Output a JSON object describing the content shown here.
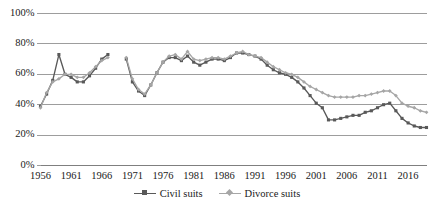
{
  "chart_data": {
    "type": "line",
    "title": "",
    "xlabel": "",
    "ylabel": "",
    "xlim": [
      1956,
      2019
    ],
    "ylim": [
      0,
      100
    ],
    "grid": true,
    "grid_axis": "y",
    "legend_position": "bottom-center",
    "y_ticks": [
      0,
      20,
      40,
      60,
      80,
      100
    ],
    "y_tick_labels": [
      "0%",
      "20%",
      "40%",
      "60%",
      "80%",
      "100%"
    ],
    "x_ticks": [
      1956,
      1961,
      1966,
      1971,
      1976,
      1981,
      1986,
      1991,
      1996,
      2001,
      2006,
      2011,
      2016
    ],
    "x_tick_labels": [
      "1956",
      "1961",
      "1966",
      "1971",
      "1976",
      "1981",
      "1986",
      "1991",
      "1996",
      "2001",
      "2006",
      "2011",
      "2016"
    ],
    "note": "Two series share the same year axis; both have a data gap for 1968 and 1969.",
    "series": [
      {
        "name": "Civil suits",
        "color": "#595959",
        "marker": "square",
        "x": [
          1956,
          1957,
          1958,
          1959,
          1960,
          1961,
          1962,
          1963,
          1964,
          1965,
          1966,
          1967,
          1968,
          1969,
          1970,
          1971,
          1972,
          1973,
          1974,
          1975,
          1976,
          1977,
          1978,
          1979,
          1980,
          1981,
          1982,
          1983,
          1984,
          1985,
          1986,
          1987,
          1988,
          1989,
          1990,
          1991,
          1992,
          1993,
          1994,
          1995,
          1996,
          1997,
          1998,
          1999,
          2000,
          2001,
          2002,
          2003,
          2004,
          2005,
          2006,
          2007,
          2008,
          2009,
          2010,
          2011,
          2012,
          2013,
          2014,
          2015,
          2016,
          2017,
          2018,
          2019
        ],
        "y": [
          39,
          47,
          56,
          73,
          60,
          58,
          55,
          55,
          59,
          64,
          70,
          73,
          null,
          null,
          70,
          55,
          49,
          46,
          53,
          61,
          68,
          71,
          71,
          69,
          72,
          68,
          66,
          68,
          70,
          70,
          69,
          71,
          74,
          74,
          73,
          72,
          70,
          66,
          63,
          61,
          60,
          58,
          55,
          51,
          46,
          41,
          38,
          30,
          30,
          31,
          32,
          33,
          33,
          35,
          36,
          38,
          40,
          41,
          36,
          31,
          28,
          26,
          25,
          25
        ]
      },
      {
        "name": "Divorce suits",
        "color": "#a6a6a6",
        "marker": "diamond",
        "x": [
          1956,
          1957,
          1958,
          1959,
          1960,
          1961,
          1962,
          1963,
          1964,
          1965,
          1966,
          1967,
          1968,
          1969,
          1970,
          1971,
          1972,
          1973,
          1974,
          1975,
          1976,
          1977,
          1978,
          1979,
          1980,
          1981,
          1982,
          1983,
          1984,
          1985,
          1986,
          1987,
          1988,
          1989,
          1990,
          1991,
          1992,
          1993,
          1994,
          1995,
          1996,
          1997,
          1998,
          1999,
          2000,
          2001,
          2002,
          2003,
          2004,
          2005,
          2006,
          2007,
          2008,
          2009,
          2010,
          2011,
          2012,
          2013,
          2014,
          2015,
          2016,
          2017,
          2018,
          2019
        ],
        "y": [
          38,
          48,
          55,
          57,
          60,
          60,
          58,
          58,
          61,
          65,
          69,
          71,
          null,
          null,
          71,
          57,
          50,
          47,
          53,
          61,
          68,
          72,
          73,
          70,
          75,
          70,
          69,
          70,
          71,
          71,
          70,
          72,
          74,
          75,
          73,
          72,
          71,
          68,
          65,
          63,
          61,
          60,
          58,
          55,
          52,
          50,
          48,
          46,
          45,
          45,
          45,
          45,
          46,
          46,
          47,
          48,
          49,
          49,
          46,
          41,
          39,
          38,
          36,
          35
        ]
      }
    ]
  },
  "legend": {
    "items": [
      {
        "label": "Civil suits"
      },
      {
        "label": "Divorce suits"
      }
    ]
  }
}
